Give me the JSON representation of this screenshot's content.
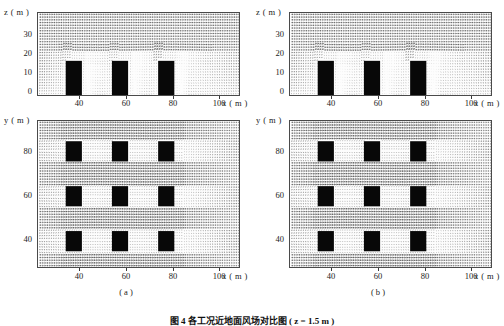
{
  "figure": {
    "caption": "图 4  各工况近地面风场对比图 ( z = 1.5 m )",
    "panels": [
      {
        "id": "a",
        "sub_label": "( a )",
        "top": {
          "y_axis_title": "z ( m )",
          "x_axis_title": "x ( m )",
          "y_ticks": [
            "30",
            "20",
            "10",
            "0"
          ],
          "x_ticks": [
            "40",
            "60",
            "80",
            "100"
          ]
        },
        "bottom": {
          "y_axis_title": "y ( m )",
          "x_axis_title": "x ( m )",
          "y_ticks": [
            "80",
            "60",
            "40"
          ],
          "x_ticks": [
            "40",
            "60",
            "80",
            "100"
          ]
        }
      },
      {
        "id": "b",
        "sub_label": "( b )",
        "top": {
          "y_axis_title": "z ( m )",
          "x_axis_title": "x ( m )",
          "y_ticks": [
            "30",
            "20",
            "10",
            "0"
          ],
          "x_ticks": [
            "40",
            "60",
            "80",
            "100"
          ]
        },
        "bottom": {
          "y_axis_title": "y ( m )",
          "x_axis_title": "x ( m )",
          "y_ticks": [
            "80",
            "60",
            "40"
          ],
          "x_ticks": [
            "40",
            "60",
            "80",
            "100"
          ]
        }
      }
    ]
  },
  "chart_data": {
    "type": "scatter",
    "title": "图 4  各工况近地面风场对比图 ( z = 1.5 m )",
    "subplots": [
      {
        "panel": "a",
        "view": "vertical-cross-section",
        "xlabel": "x ( m )",
        "ylabel": "z ( m )",
        "xlim": [
          28,
          115
        ],
        "ylim": [
          0,
          36
        ],
        "xticks": [
          40,
          60,
          80,
          100
        ],
        "yticks": [
          0,
          10,
          20,
          30
        ],
        "grid": false,
        "buildings": [
          {
            "x_start": 40,
            "x_end": 47,
            "height": 15
          },
          {
            "x_start": 60,
            "x_end": 67,
            "height": 15
          },
          {
            "x_start": 80,
            "x_end": 87,
            "height": 15
          }
        ],
        "flow_direction": "left-to-right",
        "vector_field": "uniform inflow above 20 m, sheared and separated flow below building height with recirculation in street canyons"
      },
      {
        "panel": "a",
        "view": "plan-view",
        "xlabel": "x ( m )",
        "ylabel": "y ( m )",
        "xlim": [
          28,
          115
        ],
        "ylim": [
          30,
          95
        ],
        "xticks": [
          40,
          60,
          80,
          100
        ],
        "yticks": [
          40,
          60,
          80
        ],
        "grid": false,
        "buildings": [
          {
            "x_start": 40,
            "x_end": 47,
            "y_start": 77,
            "y_end": 86
          },
          {
            "x_start": 60,
            "x_end": 67,
            "y_start": 77,
            "y_end": 86
          },
          {
            "x_start": 80,
            "x_end": 87,
            "y_start": 77,
            "y_end": 86
          },
          {
            "x_start": 40,
            "x_end": 47,
            "y_start": 57,
            "y_end": 66
          },
          {
            "x_start": 60,
            "x_end": 67,
            "y_start": 57,
            "y_end": 66
          },
          {
            "x_start": 80,
            "x_end": 87,
            "y_start": 57,
            "y_end": 66
          },
          {
            "x_start": 40,
            "x_end": 47,
            "y_start": 37,
            "y_end": 46
          },
          {
            "x_start": 60,
            "x_end": 67,
            "y_start": 37,
            "y_end": 46
          },
          {
            "x_start": 80,
            "x_end": 87,
            "y_start": 37,
            "y_end": 46
          }
        ],
        "flow_direction": "left-to-right",
        "vector_field": "channelled flow accelerating between building rows, stagnation upstream and wake downstream"
      },
      {
        "panel": "b",
        "view": "vertical-cross-section",
        "xlabel": "x ( m )",
        "ylabel": "z ( m )",
        "xlim": [
          28,
          115
        ],
        "ylim": [
          0,
          36
        ],
        "xticks": [
          40,
          60,
          80,
          100
        ],
        "yticks": [
          0,
          10,
          20,
          30
        ],
        "grid": false,
        "buildings": [
          {
            "x_start": 40,
            "x_end": 47,
            "height": 15
          },
          {
            "x_start": 60,
            "x_end": 67,
            "height": 15
          },
          {
            "x_start": 80,
            "x_end": 87,
            "height": 15
          }
        ],
        "flow_direction": "left-to-right",
        "vector_field": "uniform inflow above 20 m, sheared and separated flow below building height with recirculation in street canyons"
      },
      {
        "panel": "b",
        "view": "plan-view",
        "xlabel": "x ( m )",
        "ylabel": "y ( m )",
        "xlim": [
          28,
          115
        ],
        "ylim": [
          30,
          95
        ],
        "xticks": [
          40,
          60,
          80,
          100
        ],
        "yticks": [
          40,
          60,
          80
        ],
        "grid": false,
        "buildings": [
          {
            "x_start": 40,
            "x_end": 47,
            "y_start": 77,
            "y_end": 86
          },
          {
            "x_start": 60,
            "x_end": 67,
            "y_start": 77,
            "y_end": 86
          },
          {
            "x_start": 80,
            "x_end": 87,
            "y_start": 77,
            "y_end": 86
          },
          {
            "x_start": 40,
            "x_end": 47,
            "y_start": 57,
            "y_end": 66
          },
          {
            "x_start": 60,
            "x_end": 67,
            "y_start": 57,
            "y_end": 66
          },
          {
            "x_start": 80,
            "x_end": 87,
            "y_start": 57,
            "y_end": 66
          },
          {
            "x_start": 40,
            "x_end": 47,
            "y_start": 37,
            "y_end": 46
          },
          {
            "x_start": 60,
            "x_end": 67,
            "y_start": 37,
            "y_end": 46
          },
          {
            "x_start": 80,
            "x_end": 87,
            "y_start": 37,
            "y_end": 46
          }
        ],
        "flow_direction": "left-to-right",
        "vector_field": "channelled flow accelerating between building rows, stagnation upstream and wake downstream"
      }
    ]
  }
}
